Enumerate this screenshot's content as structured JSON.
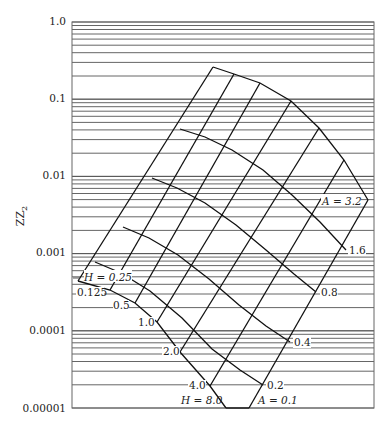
{
  "chart_data": {
    "type": "line",
    "title": "",
    "xlabel": "",
    "ylabel": "ZZ₂",
    "yscale": "log",
    "ylim": [
      1e-05,
      1.0
    ],
    "y_ticks": [
      "1.0",
      "0.1",
      "0.01",
      "0.001",
      "0.0001",
      "0.00001"
    ],
    "grid": "horizontal log minor gridlines",
    "nomograph_families": {
      "H": {
        "label_prefix": "H",
        "values": [
          "0.25",
          "0.125",
          "0.5",
          "1.0",
          "2.0",
          "4.0",
          "8.0"
        ],
        "labels": [
          "H = 0.25",
          "0.125",
          "0.5",
          "1.0",
          "2.0",
          "4.0",
          "H = 8.0"
        ]
      },
      "A": {
        "label_prefix": "A",
        "values": [
          "3.2",
          "1.6",
          "0.8",
          "0.4",
          "0.2",
          "0.1"
        ],
        "labels": [
          "A = 3.2",
          "1.6",
          "0.8",
          "0.4",
          "0.2",
          "A = 0.1"
        ]
      }
    },
    "lines_up_right": [
      [
        [
          78,
          281
        ],
        [
          213,
          67
        ]
      ],
      [
        [
          110,
          290
        ],
        [
          234,
          74
        ]
      ],
      [
        [
          135,
          303
        ],
        [
          260,
          83
        ]
      ],
      [
        [
          157,
          322
        ],
        [
          291,
          101
        ]
      ],
      [
        [
          180,
          352
        ],
        [
          319,
          128
        ]
      ],
      [
        [
          210,
          386
        ],
        [
          344,
          160
        ]
      ],
      [
        [
          249,
          408
        ],
        [
          368,
          200
        ]
      ]
    ],
    "arcs_down_right": [
      [
        [
          213,
          67
        ],
        [
          234,
          74
        ],
        [
          260,
          83
        ],
        [
          291,
          101
        ],
        [
          319,
          128
        ],
        [
          344,
          160
        ],
        [
          368,
          200
        ]
      ],
      [
        [
          180,
          129
        ],
        [
          205,
          137
        ],
        [
          232,
          150
        ],
        [
          263,
          170
        ],
        [
          292,
          195
        ],
        [
          320,
          222
        ],
        [
          346,
          250
        ]
      ],
      [
        [
          152,
          178
        ],
        [
          177,
          188
        ],
        [
          205,
          203
        ],
        [
          236,
          225
        ],
        [
          266,
          250
        ],
        [
          294,
          274
        ],
        [
          316,
          292
        ]
      ],
      [
        [
          123,
          227
        ],
        [
          149,
          238
        ],
        [
          178,
          255
        ],
        [
          209,
          279
        ],
        [
          239,
          305
        ],
        [
          266,
          326
        ],
        [
          290,
          342
        ]
      ],
      [
        [
          95,
          262
        ],
        [
          121,
          273
        ],
        [
          150,
          291
        ],
        [
          182,
          318
        ],
        [
          212,
          349
        ],
        [
          240,
          370
        ],
        [
          263,
          385
        ]
      ],
      [
        [
          78,
          281
        ],
        [
          110,
          290
        ],
        [
          135,
          303
        ],
        [
          157,
          322
        ],
        [
          180,
          352
        ],
        [
          210,
          386
        ],
        [
          226,
          408
        ]
      ]
    ],
    "extra_lines": [
      [
        [
          226,
          408
        ],
        [
          249,
          408
        ]
      ]
    ]
  },
  "axis": {
    "tick_labels": [
      "1.0",
      "0.1",
      "0.01",
      "0.001",
      "0.0001",
      "0.00001"
    ],
    "ylabel_main": "ZZ",
    "ylabel_sub": "2"
  },
  "labels": {
    "h025": "H = 0.25",
    "h0125": "0.125",
    "h05": "0.5",
    "h1": "1.0",
    "h2": "2.0",
    "h4": "4.0",
    "h8": "H = 8.0",
    "a32": "A = 3.2",
    "a16": "1.6",
    "a08": "0.8",
    "a04": "0.4",
    "a02": "0.2",
    "a01": "A = 0.1"
  }
}
